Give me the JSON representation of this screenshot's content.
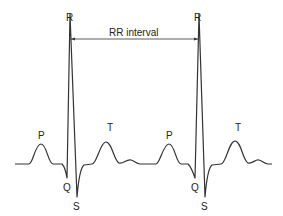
{
  "diagram": {
    "labels": {
      "r1": "R",
      "r2": "R",
      "interval": "RR interval",
      "p1": "P",
      "t1": "T",
      "q1": "Q",
      "s1": "S",
      "p2": "P",
      "t2": "T",
      "q2": "Q",
      "s2": "S"
    },
    "colors": {
      "line": "#333333",
      "background": "#ffffff"
    }
  }
}
